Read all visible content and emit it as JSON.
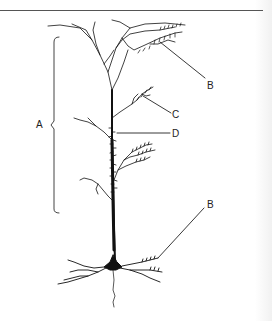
{
  "figure": {
    "type": "diagram",
    "colors": {
      "ink": "#111111",
      "rule": "#555555",
      "background": "#ffffff"
    },
    "labels": [
      {
        "id": "A",
        "text": "A",
        "x": 36,
        "y": 120,
        "points_to": "bracketed apical dendrite region"
      },
      {
        "id": "B_top",
        "text": "B",
        "x": 207,
        "y": 81,
        "points_to": "apical tuft dendrites with spines"
      },
      {
        "id": "C",
        "text": "C",
        "x": 172,
        "y": 110,
        "points_to": "oblique dendritic branch"
      },
      {
        "id": "D",
        "text": "D",
        "x": 172,
        "y": 129,
        "points_to": "spines on apical shaft"
      },
      {
        "id": "B_bottom",
        "text": "B",
        "x": 207,
        "y": 200,
        "points_to": "basal dendrites with spines"
      }
    ]
  }
}
